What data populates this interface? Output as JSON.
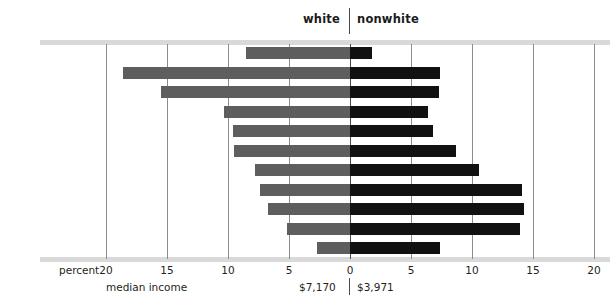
{
  "header": {
    "white_label": "white",
    "nonwhite_label": "nonwhite"
  },
  "axis": {
    "percent_caption": "percent",
    "median_income_caption": "median income",
    "tick_labels": [
      "20",
      "15",
      "10",
      "5",
      "0",
      "5",
      "10",
      "15",
      "20"
    ],
    "tick_values": [
      -20,
      -15,
      -10,
      -5,
      0,
      5,
      10,
      15,
      20
    ]
  },
  "median_income": {
    "white": "$7,170",
    "nonwhite": "$3,971"
  },
  "colors": {
    "white_bar": "#5e5e5e",
    "nonwhite_bar": "#111111",
    "gridline": "#8c8c8c",
    "rule": "#d9d9d9",
    "text": "#231f20"
  },
  "chart_data": {
    "type": "bar",
    "title": "",
    "subtitle": "",
    "orientation": "horizontal",
    "style": "diverging-population-pyramid",
    "xlabel": "percent",
    "ylabel": "",
    "xlim": [
      -20,
      20
    ],
    "xticks": [
      -20,
      -15,
      -10,
      -5,
      0,
      5,
      10,
      15,
      20
    ],
    "xticklabels": [
      "20",
      "15",
      "10",
      "5",
      "0",
      "5",
      "10",
      "15",
      "20"
    ],
    "grid": true,
    "legend_position": "top",
    "categories": [
      "$15,000 and over",
      "10,000-14,999",
      "8,000-9,999",
      "7,000-7,999",
      "6,000-6,999",
      "5,000-5,999",
      "4,000-4,999",
      "3,000-3,999",
      "2,000-2,999",
      "1,000-1,999",
      "under 1,000"
    ],
    "series": [
      {
        "name": "white",
        "side": "left",
        "color": "#5e5e5e",
        "values": [
          8.5,
          18.6,
          15.5,
          10.3,
          9.6,
          9.5,
          7.8,
          7.4,
          6.7,
          5.2,
          2.7
        ]
      },
      {
        "name": "nonwhite",
        "side": "right",
        "color": "#111111",
        "values": [
          1.8,
          7.4,
          7.3,
          6.4,
          6.8,
          8.7,
          10.6,
          14.1,
          14.3,
          13.9,
          7.4
        ]
      }
    ],
    "annotations": [
      {
        "label": "median income white",
        "value": "$7,170"
      },
      {
        "label": "median income nonwhite",
        "value": "$3,971"
      }
    ]
  }
}
